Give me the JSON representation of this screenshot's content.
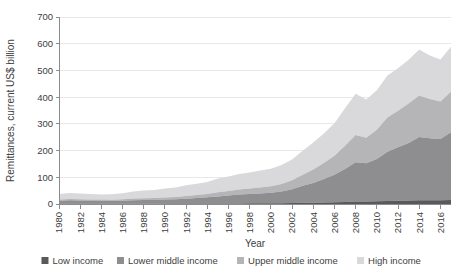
{
  "chart_data": {
    "type": "area",
    "stacked": true,
    "title": "",
    "xlabel": "Year",
    "ylabel": "Remittances, current US$ billion",
    "xlim": [
      1980,
      2017
    ],
    "ylim": [
      0,
      700
    ],
    "yticks": [
      0,
      100,
      200,
      300,
      400,
      500,
      600,
      700
    ],
    "xticks": [
      1980,
      1982,
      1984,
      1986,
      1988,
      1990,
      1992,
      1994,
      1996,
      1998,
      2000,
      2002,
      2004,
      2006,
      2008,
      2010,
      2012,
      2014,
      2016
    ],
    "grid": false,
    "legend_position": "bottom",
    "x": [
      1980,
      1981,
      1982,
      1983,
      1984,
      1985,
      1986,
      1987,
      1988,
      1989,
      1990,
      1991,
      1992,
      1993,
      1994,
      1995,
      1996,
      1997,
      1998,
      1999,
      2000,
      2001,
      2002,
      2003,
      2004,
      2005,
      2006,
      2007,
      2008,
      2009,
      2010,
      2011,
      2012,
      2013,
      2014,
      2015,
      2016,
      2017
    ],
    "series": [
      {
        "name": "Low income",
        "color": "#59595b",
        "values": [
          1.0,
          1.1,
          1.1,
          1.1,
          1.0,
          1.0,
          1.1,
          1.2,
          1.3,
          1.4,
          1.5,
          1.5,
          1.6,
          1.7,
          1.8,
          2.0,
          2.1,
          2.3,
          2.5,
          2.7,
          2.9,
          3.2,
          3.6,
          4.3,
          5.0,
          5.8,
          6.6,
          7.8,
          9.0,
          9.3,
          10.2,
          11.4,
          12.4,
          13.4,
          14.5,
          14.3,
          14.0,
          15.3
        ]
      },
      {
        "name": "Lower middle income",
        "color": "#8e8e90",
        "values": [
          11.5,
          12.8,
          12.0,
          11.6,
          11.0,
          10.8,
          11.2,
          12.8,
          13.3,
          13.8,
          15.0,
          16.2,
          18.5,
          20.6,
          23.0,
          26.5,
          29.6,
          33.2,
          34.8,
          36.8,
          39.0,
          44.0,
          52.0,
          64.0,
          74.0,
          88.0,
          103.0,
          123.0,
          147.0,
          143.0,
          158.0,
          184.0,
          200.0,
          215.0,
          236.0,
          232.0,
          229.0,
          253.0
        ]
      },
      {
        "name": "Upper middle income",
        "color": "#b5b5b7",
        "values": [
          4.5,
          5.0,
          4.8,
          4.6,
          4.4,
          4.5,
          5.2,
          6.2,
          6.7,
          7.0,
          8.2,
          8.8,
          10.2,
          11.5,
          13.0,
          15.5,
          17.0,
          19.2,
          20.5,
          22.5,
          24.5,
          28.0,
          33.0,
          41.0,
          50.0,
          60.0,
          71.0,
          87.0,
          102.0,
          96.0,
          110.0,
          128.0,
          137.0,
          148.0,
          156.0,
          147.0,
          141.0,
          152.0
        ]
      },
      {
        "name": "High income",
        "color": "#d9d9db",
        "values": [
          20.0,
          22.0,
          21.0,
          20.0,
          19.5,
          20.0,
          23.0,
          27.0,
          29.0,
          30.0,
          33.0,
          35.0,
          40.0,
          42.0,
          45.0,
          51.0,
          54.0,
          58.0,
          60.0,
          63.0,
          66.0,
          71.0,
          78.0,
          90.0,
          101.0,
          110.0,
          122.0,
          141.0,
          155.0,
          143.0,
          148.0,
          158.0,
          159.0,
          164.0,
          172.0,
          163.0,
          157.0,
          168.0
        ]
      }
    ],
    "legend": [
      {
        "label": "Low income",
        "color": "#59595b"
      },
      {
        "label": "Lower middle income",
        "color": "#8e8e90"
      },
      {
        "label": "Upper middle income",
        "color": "#b5b5b7"
      },
      {
        "label": "High income",
        "color": "#d9d9db"
      }
    ]
  },
  "axes": {
    "plot_left": 59,
    "plot_right": 451,
    "plot_top": 17,
    "plot_bottom": 204
  }
}
